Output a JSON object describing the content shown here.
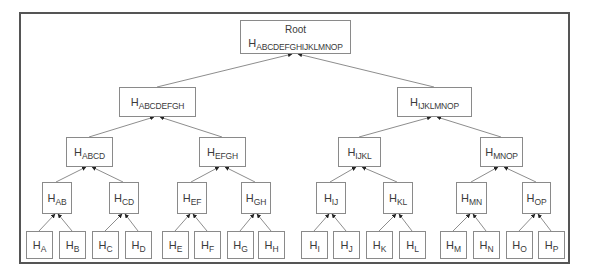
{
  "diagram": {
    "type": "merkle-tree",
    "colors": {
      "border": "#555555",
      "node_border": "#8a8a8a",
      "edge": "#808080",
      "arrow": "#222222",
      "text": "#3a3a3a"
    },
    "root": {
      "label": "Root",
      "hash_prefix": "H",
      "hash_sub": "ABCDEFGHIJKLMNOP"
    },
    "level1": [
      {
        "hash_prefix": "H",
        "hash_sub": "ABCDEFGH"
      },
      {
        "hash_prefix": "H",
        "hash_sub": "IJKLMNOP"
      }
    ],
    "level2": [
      {
        "hash_prefix": "H",
        "hash_sub": "ABCD"
      },
      {
        "hash_prefix": "H",
        "hash_sub": "EFGH"
      },
      {
        "hash_prefix": "H",
        "hash_sub": "IJKL"
      },
      {
        "hash_prefix": "H",
        "hash_sub": "MNOP"
      }
    ],
    "level3": [
      {
        "hash_prefix": "H",
        "hash_sub": "AB"
      },
      {
        "hash_prefix": "H",
        "hash_sub": "CD"
      },
      {
        "hash_prefix": "H",
        "hash_sub": "EF"
      },
      {
        "hash_prefix": "H",
        "hash_sub": "GH"
      },
      {
        "hash_prefix": "H",
        "hash_sub": "IJ"
      },
      {
        "hash_prefix": "H",
        "hash_sub": "KL"
      },
      {
        "hash_prefix": "H",
        "hash_sub": "MN"
      },
      {
        "hash_prefix": "H",
        "hash_sub": "OP"
      }
    ],
    "leaves": [
      {
        "hash_prefix": "H",
        "hash_sub": "A"
      },
      {
        "hash_prefix": "H",
        "hash_sub": "B"
      },
      {
        "hash_prefix": "H",
        "hash_sub": "C"
      },
      {
        "hash_prefix": "H",
        "hash_sub": "D"
      },
      {
        "hash_prefix": "H",
        "hash_sub": "E"
      },
      {
        "hash_prefix": "H",
        "hash_sub": "F"
      },
      {
        "hash_prefix": "H",
        "hash_sub": "G"
      },
      {
        "hash_prefix": "H",
        "hash_sub": "H"
      },
      {
        "hash_prefix": "H",
        "hash_sub": "I"
      },
      {
        "hash_prefix": "H",
        "hash_sub": "J"
      },
      {
        "hash_prefix": "H",
        "hash_sub": "K"
      },
      {
        "hash_prefix": "H",
        "hash_sub": "L"
      },
      {
        "hash_prefix": "H",
        "hash_sub": "M"
      },
      {
        "hash_prefix": "H",
        "hash_sub": "N"
      },
      {
        "hash_prefix": "H",
        "hash_sub": "O"
      },
      {
        "hash_prefix": "H",
        "hash_sub": "P"
      }
    ]
  }
}
